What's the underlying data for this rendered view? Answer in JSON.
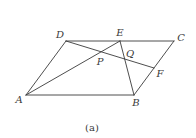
{
  "diagram": {
    "type": "geometry",
    "shape": "parallelogram ABCD with segments AE, EB, DF",
    "stroke_color": "#3a3a3a",
    "points": {
      "A": {
        "label": "A",
        "x": 26,
        "y": 95,
        "lx": 19,
        "ly": 100
      },
      "B": {
        "label": "B",
        "x": 134,
        "y": 95,
        "lx": 136,
        "ly": 103
      },
      "C": {
        "label": "C",
        "x": 174,
        "y": 41,
        "lx": 181,
        "ly": 38
      },
      "D": {
        "label": "D",
        "x": 66,
        "y": 41,
        "lx": 60,
        "ly": 35
      },
      "E": {
        "label": "E",
        "x": 120,
        "y": 41,
        "lx": 120,
        "ly": 33
      },
      "F": {
        "label": "F",
        "x": 154,
        "y": 68,
        "lx": 160,
        "ly": 74
      },
      "P": {
        "label": "P",
        "x": 102,
        "y": 52,
        "lx": 100,
        "ly": 62
      },
      "Q": {
        "label": "Q",
        "x": 125,
        "y": 59,
        "lx": 130,
        "ly": 54
      }
    },
    "segments": [
      [
        "A",
        "B"
      ],
      [
        "B",
        "C"
      ],
      [
        "C",
        "D"
      ],
      [
        "D",
        "A"
      ],
      [
        "A",
        "E"
      ],
      [
        "E",
        "B"
      ],
      [
        "D",
        "F"
      ]
    ],
    "caption": "(a)"
  }
}
